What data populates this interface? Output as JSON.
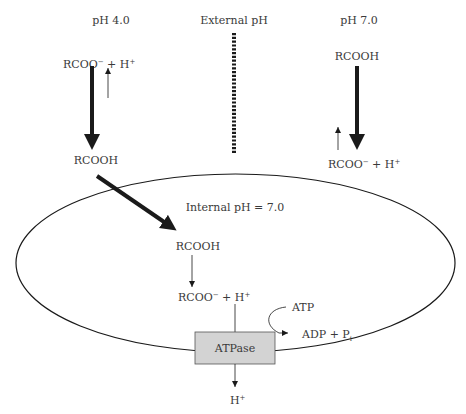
{
  "labels": {
    "left_ph": "pH 4.0",
    "center_header": "External pH",
    "right_ph": "pH 7.0",
    "internal_ph": "Internal pH = 7.0"
  },
  "left_column": {
    "top_species": {
      "base": "RCOO",
      "charge": "−",
      "plus": " + H",
      "proton_charge": "+"
    },
    "bottom_species": "RCOOH"
  },
  "right_column": {
    "top_species": "RCOOH",
    "bottom_species": {
      "base": "RCOO",
      "charge": "−",
      "plus": " + H",
      "proton_charge": "+"
    }
  },
  "internal": {
    "entered_species": "RCOOH",
    "dissociated": {
      "base": "RCOO",
      "charge": "−",
      "plus": " + H",
      "proton_charge": "+"
    },
    "atp": "ATP",
    "adp": {
      "base": "ADP + P",
      "subscript": "i"
    },
    "pump_label": "ATPase",
    "expelled": {
      "base": "H",
      "charge": "+"
    }
  },
  "colors": {
    "stroke": "#1a1a1a",
    "text": "#3a3a3a",
    "pump_fill": "#d3d3d3",
    "pump_stroke": "#555555"
  }
}
